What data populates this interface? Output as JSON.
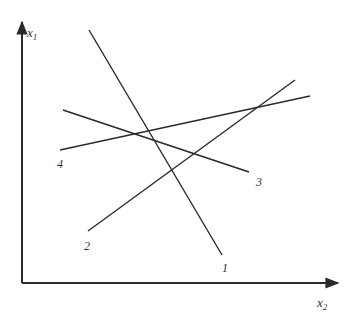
{
  "diagram": {
    "type": "line-arrangement",
    "colors": {
      "stroke": "#2a2a2a",
      "text": "#333333",
      "background": "#ffffff"
    },
    "axes": {
      "vertical": {
        "name": "x",
        "subscript": "1",
        "from": [
          22,
          283
        ],
        "to": [
          22,
          22
        ]
      },
      "horizontal": {
        "name": "x",
        "subscript": "2",
        "from": [
          22,
          283
        ],
        "to": [
          338,
          283
        ]
      }
    },
    "lines": [
      {
        "id": "1",
        "label": "1",
        "from": [
          89,
          30
        ],
        "to": [
          222,
          255
        ],
        "label_pos": [
          222,
          262
        ]
      },
      {
        "id": "2",
        "label": "2",
        "from": [
          88,
          231
        ],
        "to": [
          295,
          80
        ],
        "label_pos": [
          84,
          240
        ]
      },
      {
        "id": "3",
        "label": "3",
        "from": [
          63,
          110
        ],
        "to": [
          249,
          172
        ],
        "label_pos": [
          256,
          176
        ]
      },
      {
        "id": "4",
        "label": "4",
        "from": [
          60,
          150
        ],
        "to": [
          310,
          96
        ],
        "label_pos": [
          57,
          158
        ]
      }
    ]
  }
}
